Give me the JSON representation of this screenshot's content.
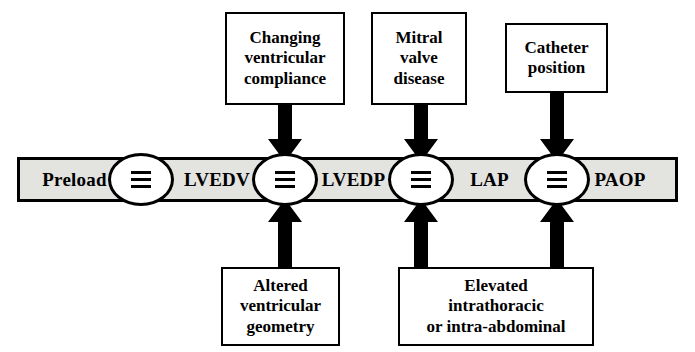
{
  "diagram": {
    "colors": {
      "segment_fill": "#e3e3e0",
      "box_fill": "#ffffff",
      "stroke": "#000000",
      "arrow": "#000000"
    },
    "chain": {
      "equivalence_symbol": "identical-to-triple-bar",
      "segments": [
        {
          "id": "preload",
          "label": "Preload"
        },
        {
          "id": "lvedv",
          "label": "LVEDV"
        },
        {
          "id": "lvedp",
          "label": "LVEDP"
        },
        {
          "id": "lap",
          "label": "LAP"
        },
        {
          "id": "paop",
          "label": "PAOP"
        }
      ],
      "nodes": [
        {
          "id": "node-1",
          "symbol": "≡",
          "between": "preload-lvedv"
        },
        {
          "id": "node-2",
          "symbol": "≡",
          "between": "lvedv-lvedp"
        },
        {
          "id": "node-3",
          "symbol": "≡",
          "between": "lvedp-lap"
        },
        {
          "id": "node-4",
          "symbol": "≡",
          "between": "lap-paop"
        }
      ]
    },
    "top_boxes": [
      {
        "id": "changing-ventricular-compliance",
        "lines": [
          "Changing",
          "ventricular",
          "compliance"
        ],
        "targets_node": "node-2",
        "arrow_direction": "down"
      },
      {
        "id": "mitral-valve-disease",
        "lines": [
          "Mitral",
          "valve",
          "disease"
        ],
        "targets_node": "node-3",
        "arrow_direction": "down"
      },
      {
        "id": "catheter-position",
        "lines": [
          "Catheter",
          "position"
        ],
        "targets_node": "node-4",
        "arrow_direction": "down"
      }
    ],
    "bottom_boxes": [
      {
        "id": "altered-ventricular-geometry",
        "lines": [
          "Altered",
          "ventricular",
          "geometry"
        ],
        "targets_node": "node-2",
        "arrow_direction": "up"
      },
      {
        "id": "elevated-intrathoracic-or-intra-abdominal",
        "lines": [
          "Elevated",
          "intrathoracic",
          "or intra-abdominal"
        ],
        "targets_nodes": [
          "node-3",
          "node-4"
        ],
        "arrow_direction": "up"
      }
    ]
  }
}
